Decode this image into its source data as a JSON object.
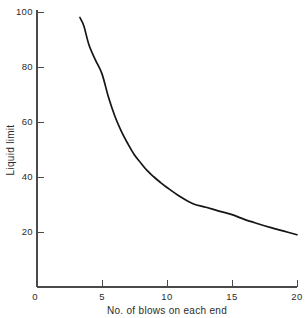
{
  "chart_data": {
    "type": "line",
    "title": "",
    "subtitle": "",
    "xlabel": "No. of blows on each end",
    "ylabel": "Liquid  limit",
    "xlim": [
      0,
      20
    ],
    "ylim": [
      0,
      100
    ],
    "xticks": [
      0,
      5,
      10,
      15,
      20
    ],
    "xtick_labels": [
      "0",
      "5",
      "10",
      "15",
      "20"
    ],
    "yticks": [
      0,
      20,
      40,
      60,
      80,
      100
    ],
    "ytick_labels": [
      "0",
      "20",
      "40",
      "60",
      "80",
      "100"
    ],
    "grid": false,
    "legend": null,
    "annotations": [],
    "series": [
      {
        "name": "flow curve",
        "color": "#151515",
        "x": [
          3.3,
          3.6,
          4.0,
          4.5,
          5.0,
          5.5,
          6.0,
          6.5,
          7.0,
          7.5,
          8.0,
          8.5,
          9.0,
          9.5,
          10.0,
          11.0,
          12.0,
          13.0,
          14.0,
          15.0,
          16.0,
          17.0,
          18.0,
          19.0,
          20.0
        ],
        "values": [
          98.0,
          95.0,
          88.0,
          82.5,
          77.5,
          69.0,
          62.0,
          56.5,
          52.0,
          48.0,
          45.0,
          42.2,
          40.0,
          38.0,
          36.2,
          32.9,
          30.3,
          29.0,
          27.6,
          26.3,
          24.5,
          23.0,
          21.6,
          20.3,
          19.0
        ]
      }
    ]
  },
  "axes": {
    "x_title": "No. of blows on each end",
    "y_title": "Liquid  limit",
    "x_tick_0": "0",
    "x_tick_1": "5",
    "x_tick_2": "10",
    "x_tick_3": "15",
    "x_tick_4": "20",
    "y_tick_0": "0",
    "y_tick_1": "20",
    "y_tick_2": "40",
    "y_tick_3": "60",
    "y_tick_4": "80",
    "y_tick_5": "100"
  },
  "colors": {
    "curve": "#151515",
    "axis": "#4a4a4a",
    "text": "#2b2b2b",
    "background": "#ffffff"
  }
}
